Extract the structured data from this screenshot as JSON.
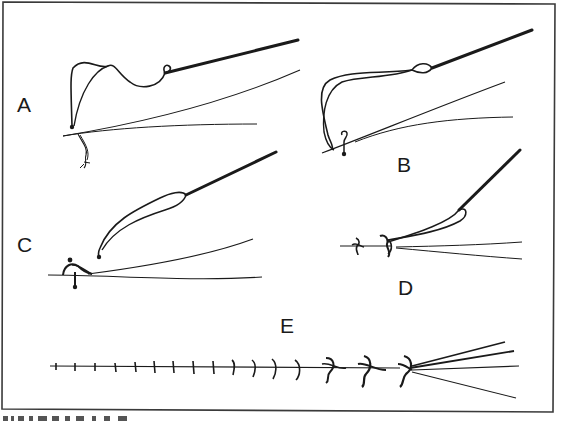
{
  "figure": {
    "panels": [
      {
        "id": "A",
        "label": "A"
      },
      {
        "id": "B",
        "label": "B"
      },
      {
        "id": "C",
        "label": "C"
      },
      {
        "id": "D",
        "label": "D"
      },
      {
        "id": "E",
        "label": "E"
      }
    ],
    "colors": {
      "ink": "#1a1a1a",
      "border": "#3a3a3a",
      "background": "#ffffff"
    }
  }
}
